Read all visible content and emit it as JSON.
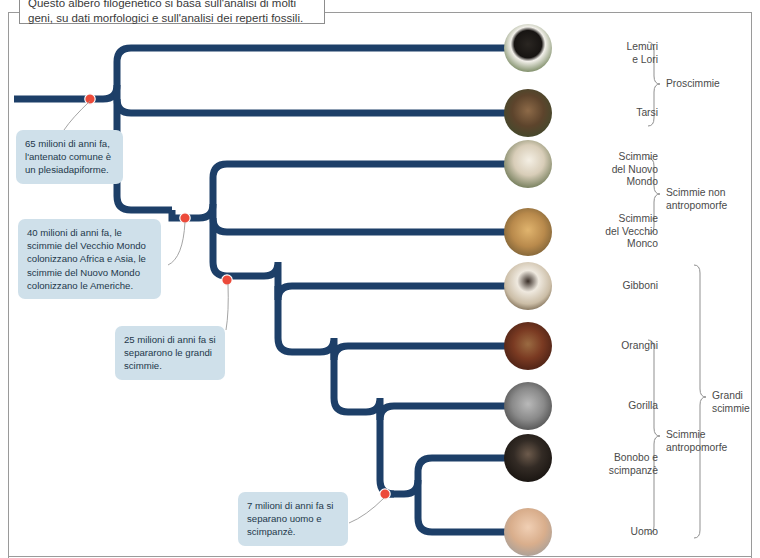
{
  "caption": {
    "text": "Questo albero filogenetico si basa sull'analisi di molti geni, su dati morfologici e sull'analisi dei reperti fossili."
  },
  "callouts": [
    {
      "id": "callout-65",
      "text": "65 milioni di anni fa, l'antenato comune è un plesiadapiforme."
    },
    {
      "id": "callout-40",
      "text": "40 milioni di anni fa, le scimmie del Vecchio Mondo colonizzano Africa e Asia, le scimmie del Nuovo Mondo colonizzano le Americhe."
    },
    {
      "id": "callout-25",
      "text": "25 milioni di anni fa si separarono le grandi scimmie."
    },
    {
      "id": "callout-7",
      "text": "7 milioni di anni fa si separano uomo e scimpanzè."
    }
  ],
  "taxa": [
    {
      "name": "lemuri-e-lori",
      "label": "Lemuri\ne Lori",
      "photo": "lemur-photo"
    },
    {
      "name": "tarsi",
      "label": "Tarsi",
      "photo": "tarsier-photo"
    },
    {
      "name": "scimmie-nuovo-mondo",
      "label": "Scimmie\ndel Nuovo\nMondo",
      "photo": "capuchin-photo"
    },
    {
      "name": "scimmie-vecchio-mondo",
      "label": "Scimmie\ndel Vecchio\nMonco",
      "photo": "macaque-photo"
    },
    {
      "name": "gibboni",
      "label": "Gibboni",
      "photo": "gibbon-photo"
    },
    {
      "name": "oranghi",
      "label": "Oranghi",
      "photo": "orangutan-photo"
    },
    {
      "name": "gorilla",
      "label": "Gorilla",
      "photo": "gorilla-photo"
    },
    {
      "name": "bonobo-e-scimpanze",
      "label": "Bonobo e\nscimpanzè",
      "photo": "chimpanzee-photo"
    },
    {
      "name": "uomo",
      "label": "Uomo",
      "photo": "human-photo"
    }
  ],
  "groups": [
    {
      "name": "proscimmie",
      "label": "Proscimmie"
    },
    {
      "name": "scimmie-non-antropomorfe",
      "label": "Scimmie non\nantropomorfe"
    },
    {
      "name": "scimmie-antropomorfe",
      "label": "Scimmie\nantropomorfe"
    },
    {
      "name": "grandi-scimmie",
      "label": "Grandi\nscimmie"
    }
  ],
  "colors": {
    "branch": "#1d3f68",
    "node": "#ec4a3a",
    "callout_bg": "#cfe0ea",
    "text": "#4a4a4a",
    "frame": "#9a9a9a"
  },
  "nodes": [
    {
      "name": "node-65my",
      "label_ref": "callout-65"
    },
    {
      "name": "node-40my",
      "label_ref": "callout-40"
    },
    {
      "name": "node-25my",
      "label_ref": "callout-25"
    },
    {
      "name": "node-7my",
      "label_ref": "callout-7"
    }
  ]
}
